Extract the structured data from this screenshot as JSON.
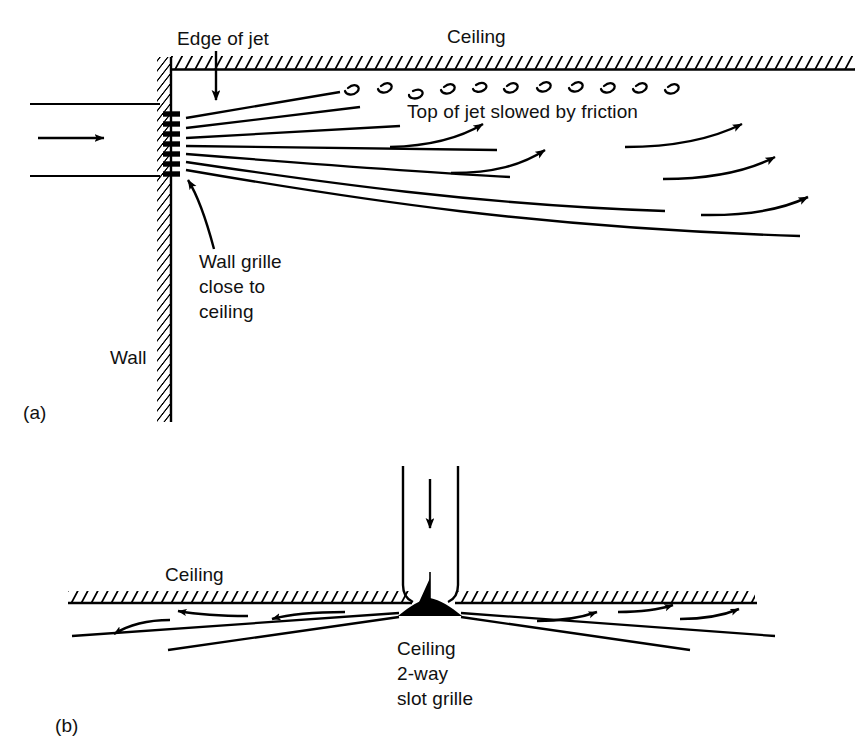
{
  "figure": {
    "line_color": "#000000",
    "hatch_color": "#000000",
    "background": "#ffffff"
  },
  "panel_a": {
    "tag": "(a)",
    "labels": {
      "edge_of_jet": "Edge of jet",
      "ceiling": "Ceiling",
      "top_of_jet": "Top of jet slowed by friction",
      "wall_grille": "Wall grille\nclose to\nceiling",
      "wall": "Wall"
    },
    "icons": {
      "edge_of_jet_pointer": "down-arrow-icon",
      "wall_grille_pointer": "curved-arrow-icon",
      "duct_flow": "right-arrow-icon",
      "eddies": "turbulence-eddy-icon"
    },
    "eddy_count": 11,
    "grille_bar_count": 7,
    "flow_arrow_count": 6
  },
  "panel_b": {
    "tag": "(b)",
    "labels": {
      "ceiling": "Ceiling",
      "slot_grille": "Ceiling\n2-way\nslot grille"
    },
    "icons": {
      "supply_duct_flow": "down-arrow-icon",
      "slot_grille": "cone-grille-icon",
      "left_flow": "left-arrow-icon",
      "right_flow": "right-arrow-icon"
    },
    "left_arrow_count": 3,
    "right_arrow_count": 3
  }
}
